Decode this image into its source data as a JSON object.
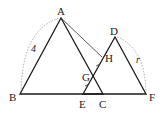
{
  "diagram": {
    "type": "geometry-figure",
    "points": {
      "A": {
        "label": "A",
        "x": 61,
        "y": 18
      },
      "B": {
        "label": "B",
        "x": 20,
        "y": 94
      },
      "C": {
        "label": "C",
        "x": 103,
        "y": 94
      },
      "D": {
        "label": "D",
        "x": 115,
        "y": 37
      },
      "E": {
        "label": "E",
        "x": 83,
        "y": 94
      },
      "F": {
        "label": "F",
        "x": 146,
        "y": 94
      },
      "G": {
        "label": "G",
        "x": 93,
        "y": 75
      },
      "H": {
        "label": "H",
        "x": 102,
        "y": 58
      }
    },
    "triangles": [
      {
        "name": "ABC",
        "vertices": [
          "A",
          "B",
          "C"
        ]
      },
      {
        "name": "DEF",
        "vertices": [
          "D",
          "E",
          "F"
        ]
      }
    ],
    "segments": [
      {
        "name": "AH",
        "from": "A",
        "to": "H"
      }
    ],
    "measurements": {
      "AB_label": "4",
      "DF_label": "r"
    },
    "equal_marks": [
      "EG",
      "GH"
    ]
  }
}
